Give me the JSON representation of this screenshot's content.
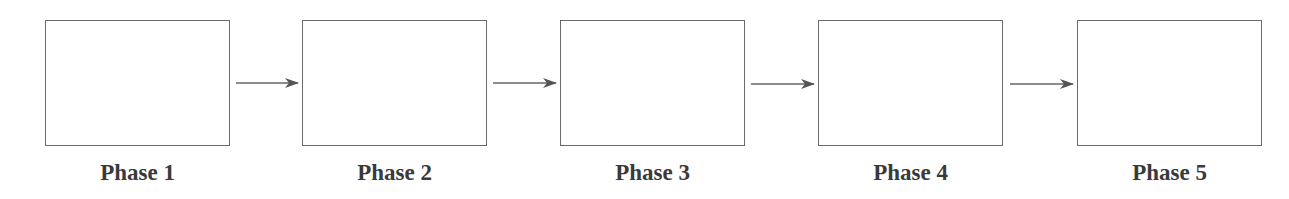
{
  "diagram": {
    "type": "linear-process-flow",
    "phases": [
      {
        "label": "Phase 1",
        "x": 45
      },
      {
        "label": "Phase 2",
        "x": 302
      },
      {
        "label": "Phase 3",
        "x": 560
      },
      {
        "label": "Phase 4",
        "x": 818
      },
      {
        "label": "Phase 5",
        "x": 1077
      }
    ],
    "colors": {
      "stroke": "#6a6a6a",
      "arrow": "#555555",
      "text": "#3a3a3a"
    }
  }
}
